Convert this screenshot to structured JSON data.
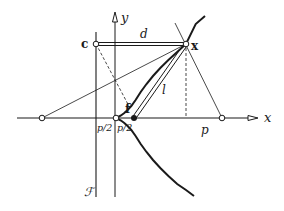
{
  "diagram": {
    "type": "parabola-geometry",
    "labels": {
      "y_axis": "y",
      "x_axis": "x",
      "point_c": "c",
      "point_x": "x",
      "focus": "f",
      "distance_d": "d",
      "distance_l": "l",
      "distance_p": "p",
      "half_p_left": "p/2",
      "half_p_right": "p/2",
      "directrix": "ℱ"
    },
    "colors": {
      "ink": "#1a1a1a",
      "background": "#ffffff"
    }
  }
}
